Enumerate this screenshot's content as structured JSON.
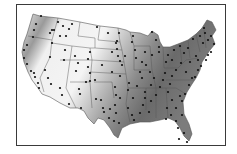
{
  "figure": {
    "type": "map",
    "region": "contiguous-united-states",
    "style": "grayscale-shaded-with-station-points",
    "colors": {
      "frame": "#3a3a3a",
      "land_light": "#f2f2f2",
      "land_mid": "#b8b8b8",
      "land_dark": "#6e6e6e",
      "state_lines": "#555555",
      "points": "#111111",
      "background": "#ffffff"
    },
    "points": [
      [
        41,
        16
      ],
      [
        36,
        24
      ],
      [
        34,
        30
      ],
      [
        33,
        37
      ],
      [
        27,
        45
      ],
      [
        24,
        50
      ],
      [
        24,
        58
      ],
      [
        27,
        64
      ],
      [
        31,
        71
      ],
      [
        35,
        77
      ],
      [
        38,
        83
      ],
      [
        39,
        88
      ],
      [
        34,
        73
      ],
      [
        52,
        30
      ],
      [
        50,
        33
      ],
      [
        54,
        30
      ],
      [
        58,
        22
      ],
      [
        63,
        26
      ],
      [
        69,
        29
      ],
      [
        72,
        24
      ],
      [
        66,
        36
      ],
      [
        60,
        36
      ],
      [
        52,
        43
      ],
      [
        50,
        57
      ],
      [
        45,
        70
      ],
      [
        48,
        78
      ],
      [
        51,
        84
      ],
      [
        65,
        50
      ],
      [
        64,
        60
      ],
      [
        75,
        56
      ],
      [
        76,
        71
      ],
      [
        78,
        63
      ],
      [
        88,
        59
      ],
      [
        90,
        52
      ],
      [
        88,
        67
      ],
      [
        90,
        73
      ],
      [
        86,
        82
      ],
      [
        79,
        89
      ],
      [
        80,
        94
      ],
      [
        81,
        108
      ],
      [
        69,
        104
      ],
      [
        62,
        95
      ],
      [
        60,
        88
      ],
      [
        97,
        27
      ],
      [
        108,
        33
      ],
      [
        116,
        43
      ],
      [
        117,
        49
      ],
      [
        112,
        52
      ],
      [
        102,
        65
      ],
      [
        95,
        80
      ],
      [
        90,
        81
      ],
      [
        96,
        99
      ],
      [
        101,
        100
      ],
      [
        103,
        108
      ],
      [
        119,
        33
      ],
      [
        117,
        41
      ],
      [
        125,
        56
      ],
      [
        118,
        56
      ],
      [
        120,
        61
      ],
      [
        122,
        65
      ],
      [
        112,
        72
      ],
      [
        120,
        76
      ],
      [
        115,
        87
      ],
      [
        116,
        95
      ],
      [
        120,
        98
      ],
      [
        115,
        105
      ],
      [
        110,
        109
      ],
      [
        104,
        112
      ],
      [
        109,
        118
      ],
      [
        116,
        113
      ],
      [
        119,
        123
      ],
      [
        114,
        121
      ],
      [
        133,
        36
      ],
      [
        132,
        42
      ],
      [
        135,
        50
      ],
      [
        136,
        58
      ],
      [
        145,
        52
      ],
      [
        142,
        62
      ],
      [
        140,
        72
      ],
      [
        142,
        78
      ],
      [
        137,
        86
      ],
      [
        129,
        83
      ],
      [
        128,
        90
      ],
      [
        133,
        98
      ],
      [
        128,
        108
      ],
      [
        132,
        115
      ],
      [
        134,
        120
      ],
      [
        152,
        32
      ],
      [
        156,
        40
      ],
      [
        159,
        47
      ],
      [
        159,
        52
      ],
      [
        152,
        55
      ],
      [
        146,
        65
      ],
      [
        150,
        72
      ],
      [
        154,
        78
      ],
      [
        151,
        85
      ],
      [
        145,
        92
      ],
      [
        145,
        98
      ],
      [
        143,
        105
      ],
      [
        140,
        113
      ],
      [
        149,
        112
      ],
      [
        151,
        101
      ],
      [
        156,
        95
      ],
      [
        160,
        87
      ],
      [
        163,
        80
      ],
      [
        165,
        73
      ],
      [
        168,
        55
      ],
      [
        166,
        62
      ],
      [
        172,
        60
      ],
      [
        174,
        50
      ],
      [
        180,
        46
      ],
      [
        184,
        53
      ],
      [
        181,
        63
      ],
      [
        176,
        70
      ],
      [
        172,
        76
      ],
      [
        170,
        84
      ],
      [
        168,
        92
      ],
      [
        172,
        100
      ],
      [
        167,
        108
      ],
      [
        171,
        115
      ],
      [
        176,
        121
      ],
      [
        178,
        128
      ],
      [
        184,
        133
      ],
      [
        187,
        142
      ],
      [
        188,
        48
      ],
      [
        193,
        39
      ],
      [
        200,
        36
      ],
      [
        205,
        33
      ],
      [
        203,
        43
      ],
      [
        208,
        40
      ],
      [
        211,
        36
      ],
      [
        214,
        44
      ],
      [
        196,
        56
      ],
      [
        190,
        62
      ],
      [
        186,
        72
      ],
      [
        192,
        78
      ],
      [
        189,
        85
      ],
      [
        185,
        94
      ],
      [
        182,
        101
      ],
      [
        176,
        108
      ],
      [
        182,
        115
      ],
      [
        180,
        96
      ],
      [
        198,
        60
      ],
      [
        198,
        70
      ],
      [
        201,
        66
      ],
      [
        206,
        60
      ],
      [
        208,
        55
      ],
      [
        211,
        52
      ],
      [
        204,
        28
      ],
      [
        195,
        77
      ],
      [
        166,
        119
      ],
      [
        179,
        139
      ]
    ]
  }
}
